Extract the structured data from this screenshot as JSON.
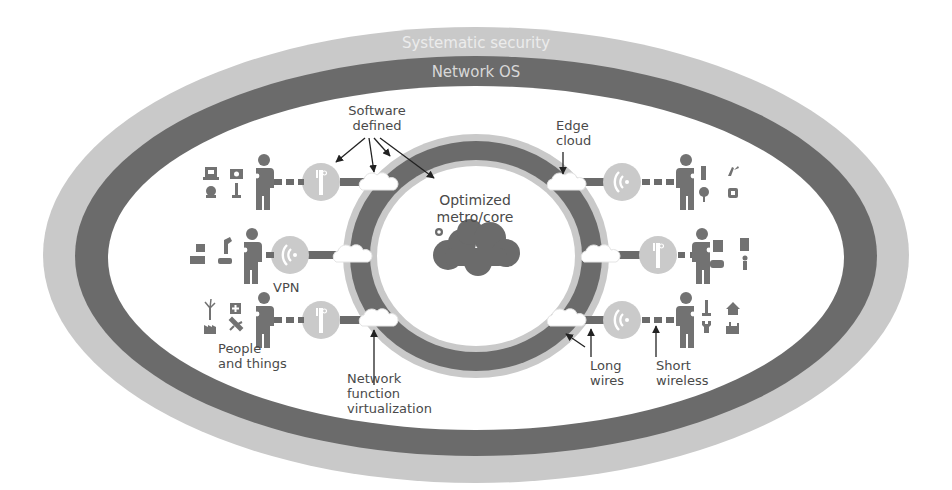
{
  "colors": {
    "light_band": "#c9c9c9",
    "dark_band": "#6b6b6b",
    "icon": "#727272",
    "antenna_circle": "#cacaca",
    "text": "#4a4a4a",
    "band_text_light": "#ececec",
    "band_text_dark": "#d6d6d6",
    "background": "#ffffff"
  },
  "outer_bands": {
    "security_label": "Systematic security",
    "network_os_label": "Network OS"
  },
  "center": {
    "label_line1": "Optimized",
    "label_line2": "metro/core"
  },
  "callouts": {
    "software_defined": {
      "line1": "Software",
      "line2": "defined"
    },
    "edge_cloud": {
      "line1": "Edge",
      "line2": "cloud"
    },
    "vpn": {
      "line1": "VPN"
    },
    "people_things": {
      "line1": "People",
      "line2": "and things"
    },
    "nfv": {
      "line1": "Network",
      "line2": "function",
      "line3": "virtualization"
    },
    "long_wires": {
      "line1": "Long",
      "line2": "wires"
    },
    "short_wireless": {
      "line1": "Short",
      "line2": "wireless"
    }
  },
  "rows": [
    {
      "side": "left",
      "position": "top",
      "antenna": "antenna-mast",
      "devices": [
        "monitor-icon",
        "camera-icon",
        "webcam-icon",
        "lamp-icon"
      ]
    },
    {
      "side": "left",
      "position": "middle",
      "antenna": "wifi",
      "devices": [
        "box-icon",
        "robot-arm-icon",
        "truck-icon",
        "scale-icon"
      ]
    },
    {
      "side": "left",
      "position": "bottom",
      "antenna": "antenna-mast",
      "devices": [
        "wind-turbine-icon",
        "medical-cross-icon",
        "factory-icon",
        "plane-icon"
      ]
    },
    {
      "side": "right",
      "position": "top",
      "antenna": "wifi",
      "devices": [
        "phone-icon",
        "plug-icon",
        "tree-icon",
        "watch-icon"
      ]
    },
    {
      "side": "right",
      "position": "middle",
      "antenna": "antenna-mast",
      "devices": [
        "printer-icon",
        "server-icon",
        "car-icon",
        "person-small-icon"
      ]
    },
    {
      "side": "right",
      "position": "bottom",
      "antenna": "wifi",
      "devices": [
        "tower-icon",
        "house-icon",
        "antenna-tower-icon",
        "factory-icon"
      ]
    }
  ]
}
